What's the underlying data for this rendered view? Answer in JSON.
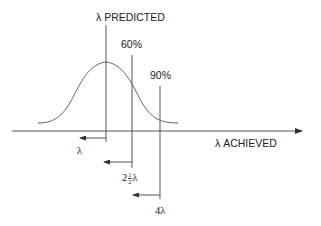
{
  "diagram": {
    "labels": {
      "predicted": "λ PREDICTED",
      "achieved": "λ ACHIEVED",
      "pct60": "60%",
      "pct90": "90%",
      "arrow1": "λ",
      "arrow2_whole": "2",
      "arrow2_num": "1",
      "arrow2_den": "2",
      "arrow2_sym": "λ",
      "arrow3": "4λ"
    },
    "elements": {
      "curve": "normal-distribution",
      "vertical_markers": [
        {
          "name": "predicted",
          "x": 106
        },
        {
          "name": "60%",
          "x": 132
        },
        {
          "name": "90%",
          "x": 160
        }
      ],
      "horizontal_axis": {
        "label": "λ ACHIEVED",
        "direction": "right"
      }
    },
    "colors": {
      "line": "#333333",
      "background": "#ffffff"
    }
  }
}
